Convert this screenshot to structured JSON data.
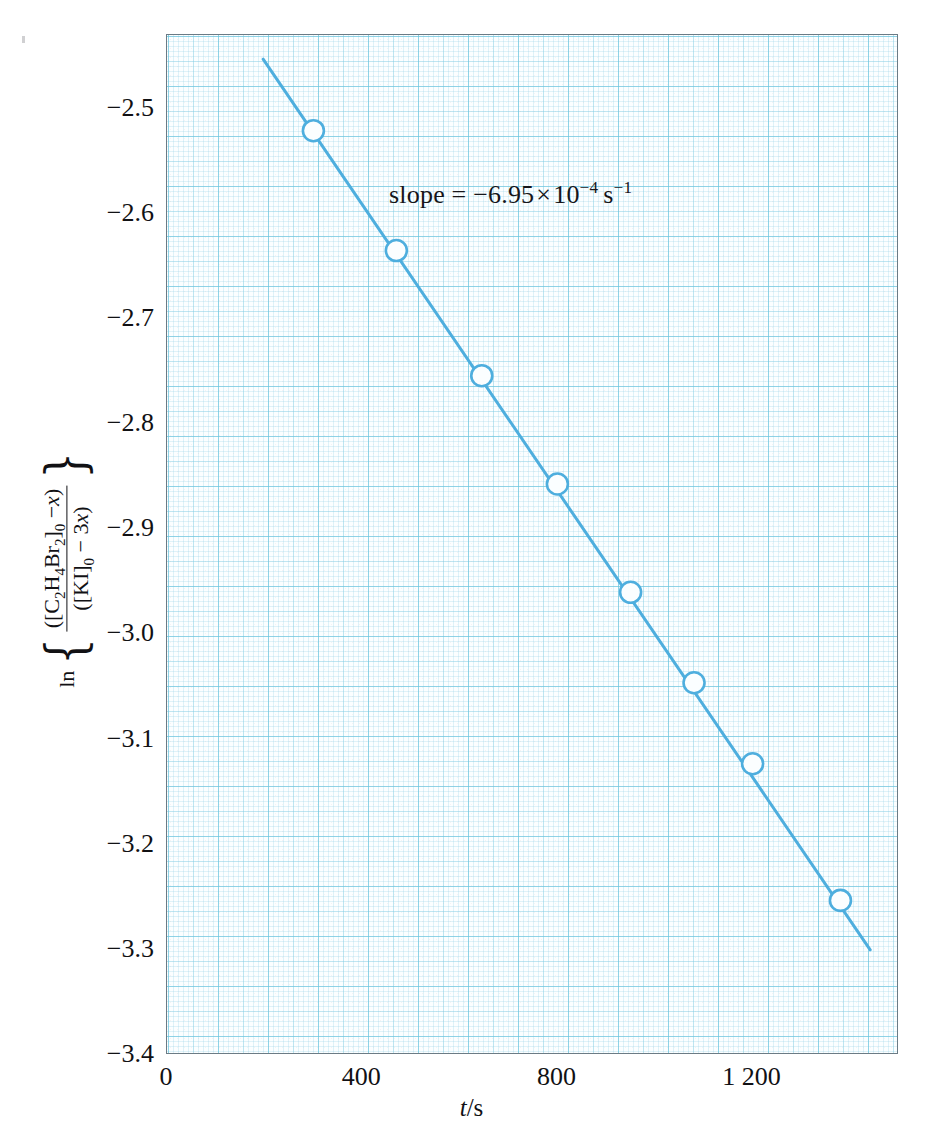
{
  "chart_data": {
    "type": "scatter",
    "title": "",
    "subtitle": "",
    "xlabel_plain": "t/s",
    "xlabel_parts": {
      "variable": "t",
      "separator": "/",
      "unit": "s"
    },
    "ylabel_plain": "ln{([C2H4Br2]0 - x)/([KI]0 - 3x)}",
    "ylabel_parts": {
      "function": "ln",
      "open_brace": "{",
      "close_brace": "}",
      "numerator": "([C2H4Br2]0 − x)",
      "denominator": "([KI]0 − 3x)",
      "numerator_tokens": [
        "([C",
        "2",
        "H",
        "4",
        "Br",
        "2",
        "]",
        "0",
        " − ",
        "x",
        ")"
      ],
      "denominator_tokens": [
        "([KI]",
        "0",
        " − 3",
        "x",
        ")"
      ]
    },
    "x": [
      300,
      470,
      645,
      800,
      950,
      1080,
      1200,
      1380
    ],
    "y": [
      -2.521,
      -2.635,
      -2.754,
      -2.857,
      -2.96,
      -3.046,
      -3.123,
      -3.253
    ],
    "xlim": [
      0,
      1500
    ],
    "ylim": [
      -3.4,
      -2.43
    ],
    "xticks": [
      0,
      400,
      800,
      1200
    ],
    "xticklabels": [
      "0",
      "400",
      "800",
      "1 200"
    ],
    "yticks": [
      -2.5,
      -2.6,
      -2.7,
      -2.8,
      -2.9,
      -3.0,
      -3.1,
      -3.2,
      -3.3,
      -3.4
    ],
    "yticklabels": [
      "−2.5",
      "−2.6",
      "−2.7",
      "−2.8",
      "−2.9",
      "−3.0",
      "−3.1",
      "−3.2",
      "−3.3",
      "−3.4"
    ],
    "grid": true,
    "grid_style": "graph-paper",
    "legend": null,
    "marker": "open-circle",
    "fit_line": {
      "x_start": 197,
      "y_start": -2.453,
      "x_end": 1441,
      "y_end": -3.3
    },
    "annotations": [
      {
        "id": "slope",
        "label": "slope = ",
        "value": "−6.95",
        "times": "×",
        "base": "10",
        "exponent": "−4",
        "unit": "s",
        "unit_exponent": "−1",
        "plain": "slope = −6.95 × 10⁻⁴ s⁻¹"
      }
    ],
    "colors": {
      "series": "#4eaede",
      "grid_major": "#68c4dd",
      "grid_minor": "#9ed7e8",
      "frame": "#6b7b85",
      "plot_background": "#fbfeff",
      "text": "#111114",
      "page_background": "#ffffff"
    }
  }
}
